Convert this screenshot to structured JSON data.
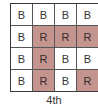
{
  "diagram": {
    "caption": "4th",
    "colors": {
      "B": "#ffffff",
      "R": "#c4958f"
    },
    "grid": [
      [
        "B",
        "B",
        "B",
        "B"
      ],
      [
        "B",
        "R",
        "R",
        "R"
      ],
      [
        "B",
        "R",
        "B",
        "B"
      ],
      [
        "B",
        "R",
        "B",
        "R"
      ]
    ]
  }
}
